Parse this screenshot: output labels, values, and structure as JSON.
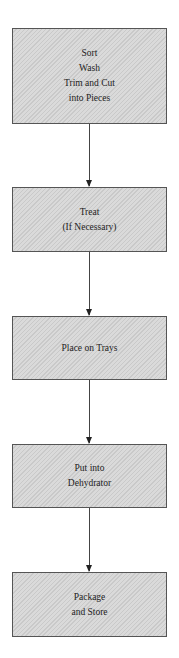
{
  "steps": [
    {
      "lines": [
        "Sort",
        "Wash",
        "Trim and Cut",
        "into Pieces"
      ]
    },
    {
      "lines": [
        "Treat",
        "(If Necessary)"
      ]
    },
    {
      "lines": [
        "Place on Trays"
      ]
    },
    {
      "lines": [
        "Put into",
        "Dehydrator"
      ]
    },
    {
      "lines": [
        "Package",
        "and Store"
      ]
    }
  ],
  "colors": {
    "box_fill": "#d4d4d4",
    "box_border": "#555555",
    "arrow": "#333333"
  }
}
